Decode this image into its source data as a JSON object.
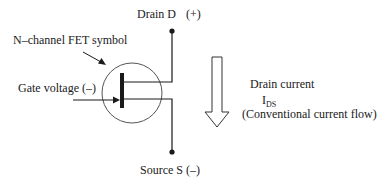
{
  "diagram": {
    "title": "N–channel FET symbol",
    "labels": {
      "drain": "Drain  D",
      "drain_polarity": "(+)",
      "fet_symbol": "N–channel FET symbol",
      "gate": "Gate voltage (–)",
      "drain_current": "Drain current",
      "ids_main": "I",
      "ids_sub": "DS",
      "conventional_flow": "(Conventional current flow)",
      "source": "Source  S",
      "source_polarity": "(–)"
    },
    "components": {
      "transistor": "n-channel-fet",
      "terminals": [
        "Drain",
        "Gate",
        "Source"
      ],
      "current_arrow": "hollow-down-arrow"
    },
    "colors": {
      "line": "#1a1a1a",
      "circle": "#555555",
      "background": "#ffffff"
    }
  }
}
